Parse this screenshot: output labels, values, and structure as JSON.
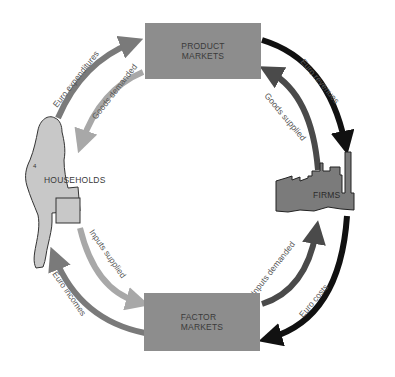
{
  "diagram": {
    "nodes": {
      "product_markets": {
        "line1": "PRODUCT",
        "line2": "MARKETS"
      },
      "factor_markets": {
        "line1": "FACTOR",
        "line2": "MARKETS"
      },
      "households": {
        "label": "HOUSEHOLDS",
        "icon": "woman-with-briefcase-silhouette"
      },
      "firms": {
        "label": "FIRMS",
        "icon": "factory-icon"
      }
    },
    "flows": {
      "euro_expenditures": {
        "label": "Euro expenditures",
        "from": "HOUSEHOLDS",
        "to": "PRODUCT MARKETS",
        "color": "#7a7a7a"
      },
      "goods_demanded": {
        "label": "Goods demanded",
        "from": "PRODUCT MARKETS",
        "to": "HOUSEHOLDS",
        "color": "#a8a8a8"
      },
      "euro_revenues": {
        "label": "Euro revenues",
        "from": "PRODUCT MARKETS",
        "to": "FIRMS",
        "color": "#111111"
      },
      "goods_supplied": {
        "label": "Goods supplied",
        "from": "FIRMS",
        "to": "PRODUCT MARKETS",
        "color": "#4a4a4a"
      },
      "inputs_supplied": {
        "label": "Inputs supplied",
        "from": "HOUSEHOLDS",
        "to": "FACTOR MARKETS",
        "color": "#a8a8a8"
      },
      "euro_incomes": {
        "label": "Euro incomes",
        "from": "FACTOR MARKETS",
        "to": "HOUSEHOLDS",
        "color": "#7a7a7a"
      },
      "inputs_demanded": {
        "label": "Inputs demanded",
        "from": "FACTOR MARKETS",
        "to": "FIRMS",
        "color": "#4a4a4a"
      },
      "euro_costs": {
        "label": "Euro costs",
        "from": "FIRMS",
        "to": "FACTOR MARKETS",
        "color": "#111111"
      }
    },
    "colors": {
      "box_fill": "#8d8d8d",
      "household_fill": "#c8c8c8",
      "firm_fill": "#7b7b7b",
      "label_text": "#3a3a3a"
    }
  }
}
